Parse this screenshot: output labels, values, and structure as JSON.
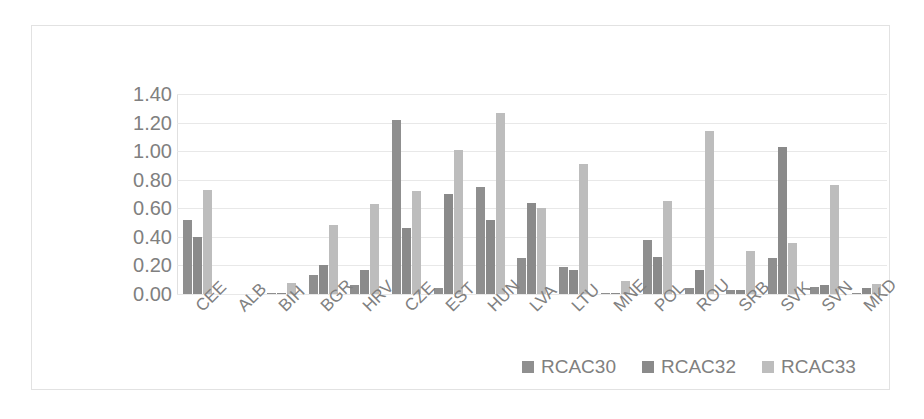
{
  "chart_data": {
    "type": "bar",
    "title": "",
    "subtitle": "",
    "xlabel": "",
    "ylabel": "",
    "ylim": [
      0,
      1.4
    ],
    "ytick_labels": [
      "1.40",
      "1.20",
      "1.00",
      "0.80",
      "0.60",
      "0.40",
      "0.20",
      "0.00"
    ],
    "ytick_values": [
      1.4,
      1.2,
      1.0,
      0.8,
      0.6,
      0.4,
      0.2,
      0.0
    ],
    "grid": true,
    "legend_position": "bottom",
    "categories": [
      "CEE",
      "ALB",
      "BIH",
      "BGR",
      "HRV",
      "CZE",
      "EST",
      "HUN",
      "LVA",
      "LTU",
      "MNE",
      "POL",
      "ROU",
      "SRB",
      "SVK",
      "SVN",
      "MKD"
    ],
    "series": [
      {
        "name": "RCAC30",
        "color": "#8f8f8f",
        "values": [
          0.52,
          0.0,
          0.01,
          0.13,
          0.06,
          1.22,
          0.04,
          0.75,
          0.25,
          0.19,
          0.01,
          0.38,
          0.04,
          0.03,
          0.25,
          0.05,
          0.01
        ]
      },
      {
        "name": "RCAC32",
        "color": "#8a8a8a",
        "values": [
          0.4,
          0.0,
          0.01,
          0.2,
          0.17,
          0.46,
          0.7,
          0.52,
          0.64,
          0.17,
          0.01,
          0.26,
          0.17,
          0.03,
          1.03,
          0.06,
          0.04
        ]
      },
      {
        "name": "RCAC33",
        "color": "#bdbdbd",
        "values": [
          0.73,
          0.0,
          0.08,
          0.48,
          0.63,
          0.72,
          1.01,
          1.27,
          0.6,
          0.91,
          0.09,
          0.65,
          1.14,
          0.3,
          0.36,
          0.76,
          0.07
        ]
      }
    ]
  },
  "legend": {
    "items": [
      {
        "label": "RCAC30",
        "color": "#8f8f8f"
      },
      {
        "label": "RCAC32",
        "color": "#8a8a8a"
      },
      {
        "label": "RCAC33",
        "color": "#bdbdbd"
      }
    ]
  }
}
